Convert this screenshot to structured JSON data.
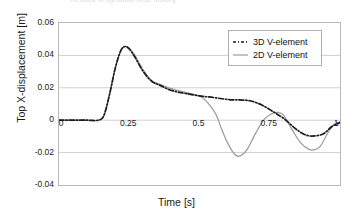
{
  "figure": {
    "cut_title": "Results of dynamic time history",
    "xlabel": "Time [s]",
    "ylabel": "Top X-displacement [m]"
  },
  "axes": {
    "yticks": [
      "0.06",
      "0.04",
      "0.02",
      "0",
      "-0.02",
      "-0.04"
    ],
    "xticks": [
      "0",
      "0.25",
      "0.5",
      "0.75",
      "1"
    ]
  },
  "legend": {
    "items": [
      {
        "label": "3D V-element",
        "style": "dash-dot",
        "color": "#1a1a1a"
      },
      {
        "label": "2D V-element",
        "style": "solid",
        "color": "#9a9a9a"
      }
    ]
  },
  "chart_data": {
    "type": "line",
    "title": "Results of dynamic time history",
    "xlabel": "Time [s]",
    "ylabel": "Top X-displacement [m]",
    "xlim": [
      0,
      1
    ],
    "ylim": [
      -0.04,
      0.06
    ],
    "grid": true,
    "legend_position": "top-right",
    "xticks": [
      0,
      0.25,
      0.5,
      0.75,
      1
    ],
    "yticks": [
      -0.04,
      -0.02,
      0,
      0.02,
      0.04,
      0.06
    ],
    "series": [
      {
        "name": "3D V-element",
        "style": "dash-dot",
        "color": "#1a1a1a",
        "x": [
          0,
          0.05,
          0.1,
          0.14,
          0.16,
          0.18,
          0.2,
          0.22,
          0.235,
          0.25,
          0.27,
          0.3,
          0.33,
          0.36,
          0.39,
          0.42,
          0.45,
          0.5,
          0.55,
          0.6,
          0.64,
          0.68,
          0.72,
          0.76,
          0.8,
          0.84,
          0.87,
          0.9,
          0.94,
          0.97,
          1.0
        ],
        "y": [
          0.0,
          0.0,
          0.0,
          0.0,
          0.003,
          0.016,
          0.032,
          0.043,
          0.0455,
          0.044,
          0.039,
          0.03,
          0.024,
          0.0215,
          0.019,
          0.0175,
          0.0165,
          0.015,
          0.014,
          0.0128,
          0.0125,
          0.012,
          0.0095,
          0.0055,
          0.001,
          -0.005,
          -0.0085,
          -0.0098,
          -0.0085,
          -0.004,
          -0.0015
        ]
      },
      {
        "name": "2D V-element",
        "style": "solid",
        "color": "#9a9a9a",
        "x": [
          0,
          0.05,
          0.1,
          0.14,
          0.16,
          0.18,
          0.2,
          0.22,
          0.235,
          0.25,
          0.27,
          0.3,
          0.33,
          0.36,
          0.39,
          0.42,
          0.45,
          0.48,
          0.51,
          0.54,
          0.56,
          0.58,
          0.6,
          0.62,
          0.635,
          0.65,
          0.67,
          0.7,
          0.73,
          0.76,
          0.78,
          0.8,
          0.83,
          0.86,
          0.89,
          0.91,
          0.93,
          0.96,
          0.98,
          1.0
        ],
        "y": [
          0.0,
          0.0,
          0.0,
          0.0,
          0.003,
          0.016,
          0.032,
          0.043,
          0.0455,
          0.0445,
          0.04,
          0.031,
          0.0245,
          0.0222,
          0.02,
          0.0185,
          0.0172,
          0.016,
          0.014,
          0.0085,
          0.003,
          -0.006,
          -0.014,
          -0.02,
          -0.0222,
          -0.0215,
          -0.018,
          -0.008,
          0.0005,
          0.0042,
          0.0048,
          0.003,
          -0.006,
          -0.014,
          -0.018,
          -0.0182,
          -0.016,
          -0.007,
          -0.0025,
          -0.0012
        ]
      }
    ]
  }
}
